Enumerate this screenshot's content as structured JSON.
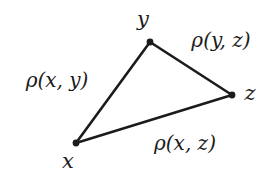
{
  "figure": {
    "background_color": "#ffffff",
    "stroke_color": "#1b1b1b",
    "text_color": "#1b1b1b",
    "width": 278,
    "height": 175,
    "vertices": [
      {
        "id": "x",
        "label": "x",
        "x": 76,
        "y": 143,
        "label_x": 68,
        "label_y": 161
      },
      {
        "id": "y",
        "label": "y",
        "x": 150,
        "y": 42,
        "label_x": 143,
        "label_y": 19
      },
      {
        "id": "z",
        "label": "z",
        "x": 232,
        "y": 95,
        "label_x": 250,
        "label_y": 93
      }
    ],
    "edges": [
      {
        "id": "xy",
        "from": "x",
        "to": "y",
        "label": "ρ(x, y)",
        "label_x": 57,
        "label_y": 80
      },
      {
        "id": "yz",
        "from": "y",
        "to": "z",
        "label": "ρ(y, z)",
        "label_x": 221,
        "label_y": 40
      },
      {
        "id": "xz",
        "from": "x",
        "to": "z",
        "label": "ρ(x, z)",
        "label_x": 185,
        "label_y": 143
      }
    ]
  }
}
